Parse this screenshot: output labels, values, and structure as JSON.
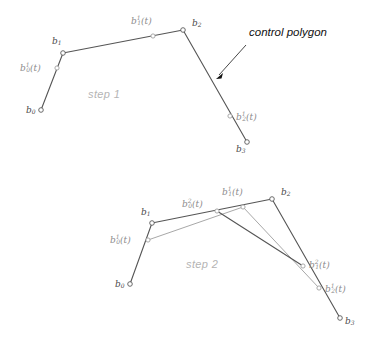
{
  "figure": {
    "title_annotation": "control polygon",
    "background": "#ffffff",
    "colors": {
      "polygon_dark": "#555555",
      "polygon_light": "#a8a8a8",
      "label_gray": "#8c8c8c",
      "label_dark": "#4a4a4a",
      "step_label": "#b4b4b4",
      "annotation_black": "#111111"
    },
    "steps": [
      {
        "id": "step-1",
        "caption": "step 1",
        "caption_pos": {
          "x": 88,
          "y": 98
        },
        "control_points": [
          {
            "name": "b0",
            "base": "b",
            "sub": "0",
            "sup": "",
            "x": 41,
            "y": 110,
            "label_x": 26,
            "label_y": 110,
            "shade": "dark"
          },
          {
            "name": "b1",
            "base": "b",
            "sub": "1",
            "sup": "",
            "x": 63,
            "y": 53,
            "label_x": 52,
            "label_y": 41,
            "shade": "dark"
          },
          {
            "name": "b2",
            "base": "b",
            "sub": "2",
            "sup": "",
            "x": 183,
            "y": 30,
            "label_x": 192,
            "label_y": 23,
            "shade": "dark"
          },
          {
            "name": "b3",
            "base": "b",
            "sub": "3",
            "sup": "",
            "x": 247,
            "y": 142,
            "label_x": 236,
            "label_y": 149,
            "shade": "dark"
          }
        ],
        "interpolated_points": [
          {
            "name": "b0_1",
            "base": "b",
            "sub": "0",
            "sup": "1",
            "x": 57,
            "y": 68,
            "label_x": 20,
            "label_y": 68,
            "anchor": "start"
          },
          {
            "name": "b1_1",
            "base": "b",
            "sub": "1",
            "sup": "1",
            "x": 153,
            "y": 36,
            "label_x": 131,
            "label_y": 21,
            "anchor": "start"
          },
          {
            "name": "b2_1",
            "base": "b",
            "sub": "2",
            "sup": "1",
            "x": 230,
            "y": 116,
            "label_x": 236,
            "label_y": 117,
            "anchor": "start"
          }
        ],
        "polygon_path": "41,110 63,53 183,30 247,142",
        "annotation": {
          "text": "control polygon",
          "text_x": 249,
          "text_y": 36,
          "line_from": {
            "x": 246,
            "y": 45
          },
          "line_to": {
            "x": 216,
            "y": 78
          }
        }
      },
      {
        "id": "step-2",
        "caption": "step 2",
        "caption_pos": {
          "x": 186,
          "y": 268
        },
        "control_points": [
          {
            "name": "b0",
            "base": "b",
            "sub": "0",
            "sup": "",
            "x": 130,
            "y": 284,
            "label_x": 115,
            "label_y": 284,
            "shade": "dark"
          },
          {
            "name": "b1",
            "base": "b",
            "sub": "1",
            "sup": "",
            "x": 152,
            "y": 223,
            "label_x": 141,
            "label_y": 212,
            "shade": "dark"
          },
          {
            "name": "b2",
            "base": "b",
            "sub": "2",
            "sup": "",
            "x": 272,
            "y": 199,
            "label_x": 281,
            "label_y": 192,
            "shade": "dark"
          },
          {
            "name": "b3",
            "base": "b",
            "sub": "3",
            "sup": "",
            "x": 340,
            "y": 318,
            "label_x": 345,
            "label_y": 321,
            "shade": "dark"
          }
        ],
        "interpolated_points_1": [
          {
            "name": "b0_1",
            "base": "b",
            "sub": "0",
            "sup": "1",
            "x": 148,
            "y": 240,
            "label_x": 110,
            "label_y": 240,
            "anchor": "start"
          },
          {
            "name": "b1_1",
            "base": "b",
            "sub": "1",
            "sup": "1",
            "x": 243,
            "y": 207,
            "label_x": 222,
            "label_y": 192,
            "anchor": "start"
          },
          {
            "name": "b2_1",
            "base": "b",
            "sub": "2",
            "sup": "1",
            "x": 319,
            "y": 288,
            "label_x": 325,
            "label_y": 289,
            "anchor": "start"
          }
        ],
        "interpolated_points_2": [
          {
            "name": "b0_2",
            "base": "b",
            "sub": "0",
            "sup": "2",
            "x": 217,
            "y": 211,
            "label_x": 182,
            "label_y": 204,
            "anchor": "start"
          },
          {
            "name": "b1_2",
            "base": "b",
            "sub": "1",
            "sup": "2",
            "x": 303,
            "y": 266,
            "label_x": 309,
            "label_y": 265,
            "anchor": "start"
          }
        ],
        "polygon_path_dark": "130,284 152,223 272,199 340,318",
        "polyline_level1": "148,240 243,207 319,288",
        "polyline_level2": "217,211 303,266"
      }
    ]
  }
}
